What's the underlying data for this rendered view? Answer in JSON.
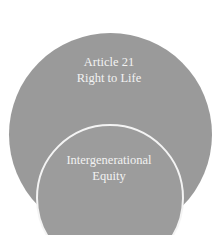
{
  "diagram": {
    "outer_circle": {
      "line1": "Article 21",
      "line2": "Right to Life",
      "fill": "#9a9a9a"
    },
    "inner_circle": {
      "line1": "Intergenerational",
      "line2": "Equity",
      "fill": "#9c9c9c",
      "stroke": "#f4f4f4"
    },
    "text_color": "#f2f2f2"
  }
}
